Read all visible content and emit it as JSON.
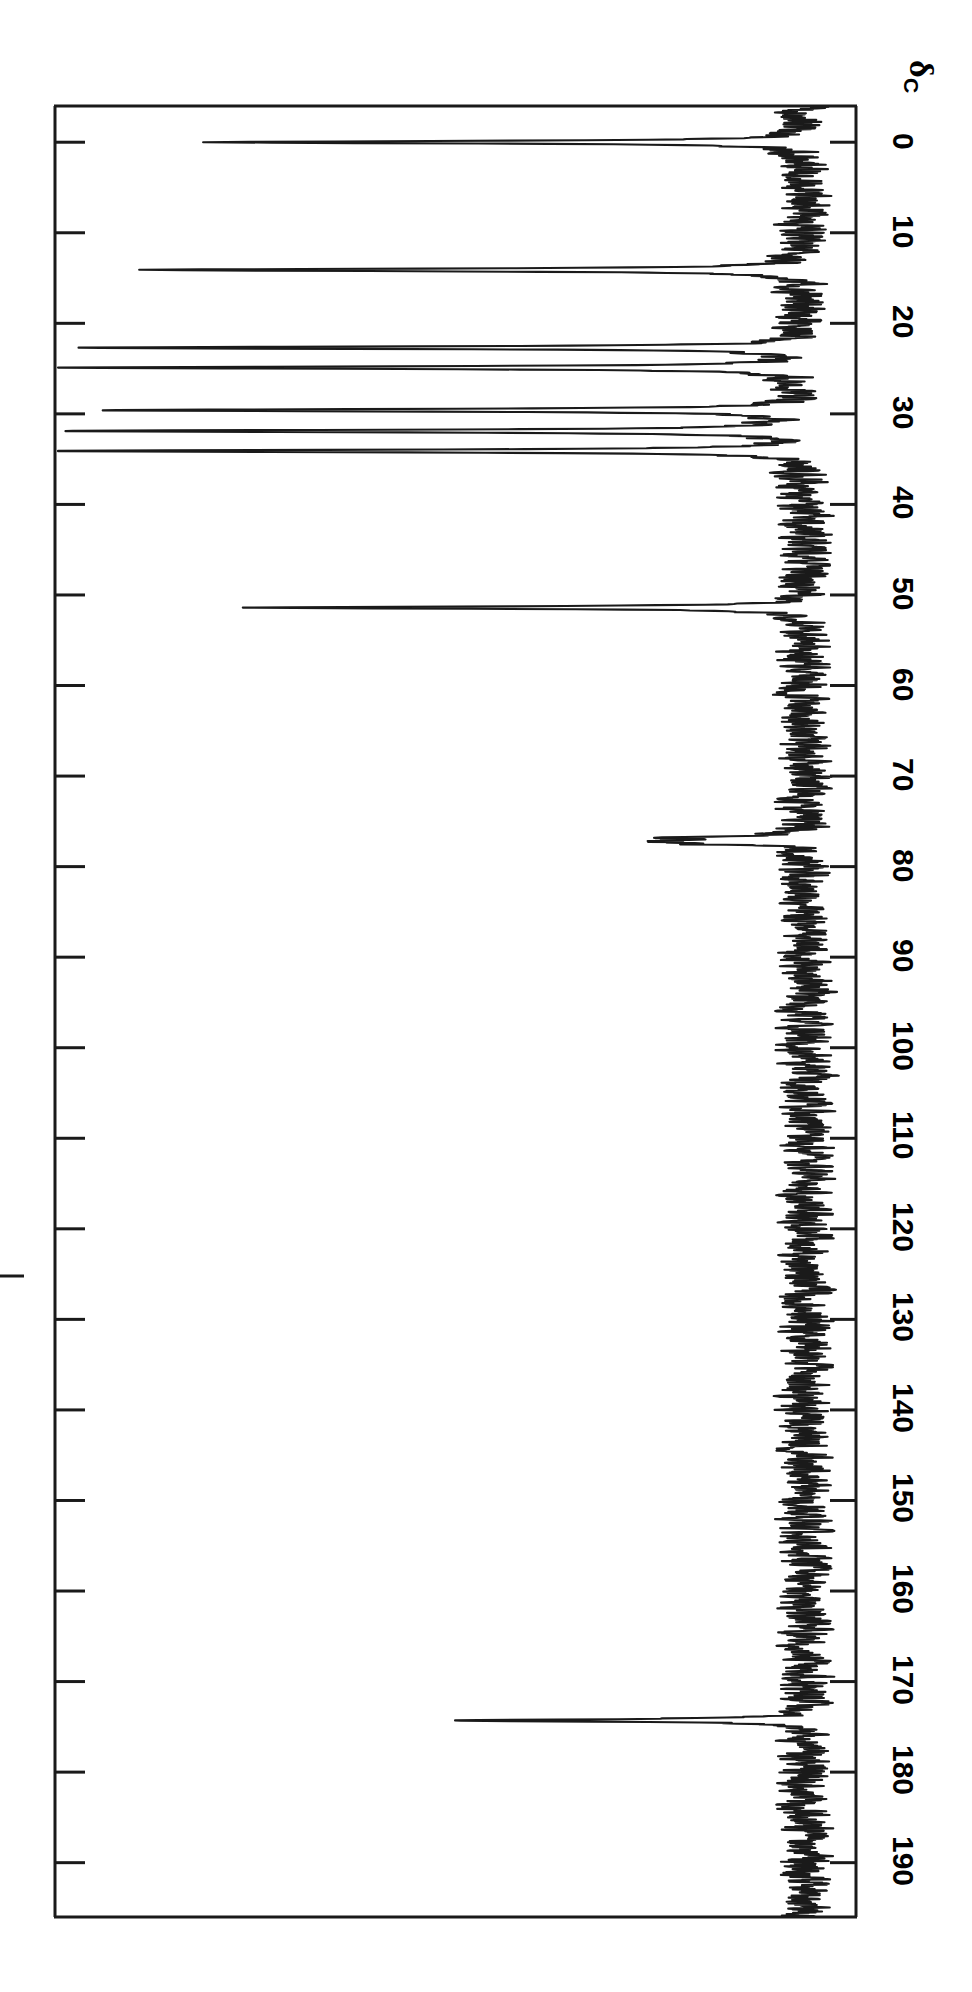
{
  "figure": {
    "kind": "nmr-spectrum",
    "orientation": "rotated-90",
    "background_color": "#ffffff",
    "trace_color": "#1a1a1a",
    "frame_color": "#1a1a1a"
  },
  "axis": {
    "title_main": "δ",
    "title_sub": "C",
    "tick_labels": [
      "0",
      "10",
      "20",
      "30",
      "40",
      "50",
      "60",
      "70",
      "80",
      "90",
      "100",
      "110",
      "120",
      "130",
      "140",
      "150",
      "160",
      "170",
      "180",
      "190"
    ],
    "tick_values": [
      0,
      10,
      20,
      30,
      40,
      50,
      60,
      70,
      80,
      90,
      100,
      110,
      120,
      130,
      140,
      150,
      160,
      170,
      180,
      190
    ],
    "range_min": -4,
    "range_max": 196,
    "direction": "increasing-downward"
  },
  "chart_data": {
    "type": "line",
    "title": "",
    "subtitle": "",
    "xlabel": "δC (ppm)",
    "ylabel": "Intensity",
    "xlim": [
      196,
      -4
    ],
    "ylim": [
      0,
      1
    ],
    "grid": false,
    "legend": null,
    "axis_inverted": true,
    "nucleus": "13C",
    "units": "ppm",
    "baseline_noise_amplitude": 0.035,
    "peaks": [
      {
        "ppm": 0.0,
        "intensity": 0.8,
        "label": "TMS / reference",
        "truncated": true
      },
      {
        "ppm": 14.1,
        "intensity": 0.9,
        "label": "CH3",
        "truncated": true
      },
      {
        "ppm": 22.7,
        "intensity": 0.98,
        "label": "CH2",
        "truncated": true
      },
      {
        "ppm": 24.9,
        "intensity": 0.99,
        "label": "CH2",
        "truncated": true
      },
      {
        "ppm": 29.6,
        "intensity": 0.92,
        "label": "CH2 envelope",
        "truncated": true
      },
      {
        "ppm": 31.9,
        "intensity": 1.0,
        "label": "CH2",
        "truncated": true
      },
      {
        "ppm": 34.1,
        "intensity": 1.0,
        "label": "CH2-C=O",
        "truncated": true
      },
      {
        "ppm": 51.4,
        "intensity": 0.72,
        "label": "OCH3",
        "truncated": true
      },
      {
        "ppm": 76.8,
        "intensity": 0.14,
        "label": "CDCl3",
        "truncated": false
      },
      {
        "ppm": 77.2,
        "intensity": 0.17,
        "label": "CDCl3",
        "truncated": false
      },
      {
        "ppm": 77.5,
        "intensity": 0.12,
        "label": "CDCl3",
        "truncated": false
      },
      {
        "ppm": 174.3,
        "intensity": 0.48,
        "label": "C=O ester",
        "truncated": true
      }
    ]
  }
}
